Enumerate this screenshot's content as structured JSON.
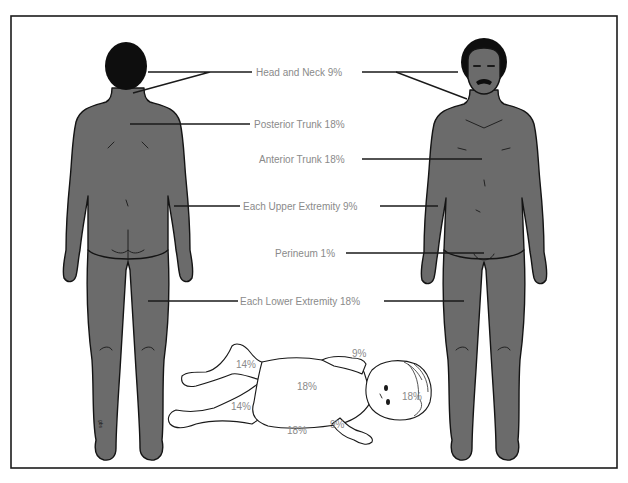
{
  "figure": {
    "colors": {
      "skin": "#6b6b6b",
      "outline": "#141414",
      "label_text": "#8a8a8a",
      "background": "#ffffff"
    }
  },
  "adult_labels": {
    "head_neck": "Head and Neck 9%",
    "posterior_trunk": "Posterior Trunk 18%",
    "anterior_trunk": "Anterior Trunk 18%",
    "upper_extremity": "Each Upper Extremity 9%",
    "perineum": "Perineum 1%",
    "lower_extremity": "Each Lower Extremity 18%"
  },
  "infant_labels": {
    "upper_leg": "14%",
    "lower_leg": "14%",
    "trunk_front": "18%",
    "trunk_back": "18%",
    "arm_upper": "9%",
    "arm_lower": "9%",
    "head": "18%"
  },
  "figures": {
    "posterior_adult": "Adult posterior view",
    "anterior_adult": "Adult anterior view",
    "infant": "Infant lying supine"
  },
  "signature": "gbs"
}
